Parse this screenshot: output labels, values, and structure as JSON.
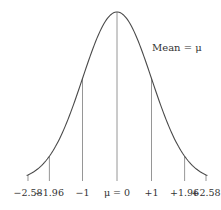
{
  "chart_data": {
    "type": "line",
    "title": "",
    "subtitle": "",
    "xlabel": "",
    "ylabel": "",
    "annotation": "Mean = μ",
    "x_ticks": [
      {
        "value": -2.58,
        "label": "−2.58"
      },
      {
        "value": -1.96,
        "label": "−1.96"
      },
      {
        "value": -1,
        "label": "−1"
      },
      {
        "value": 0,
        "label": "μ = 0"
      },
      {
        "value": 1,
        "label": "+1"
      },
      {
        "value": 1.96,
        "label": "+1.96"
      },
      {
        "value": 2.58,
        "label": "+2.58"
      }
    ],
    "xlim": [
      -3.2,
      3.2
    ],
    "grid": false,
    "legend": "none",
    "series": [
      {
        "name": "normal density",
        "mean": 0,
        "sd": 1
      }
    ],
    "colors": {
      "curve": "#4a4a4a",
      "lines": "#8a8a8a",
      "text": "#333333"
    }
  }
}
